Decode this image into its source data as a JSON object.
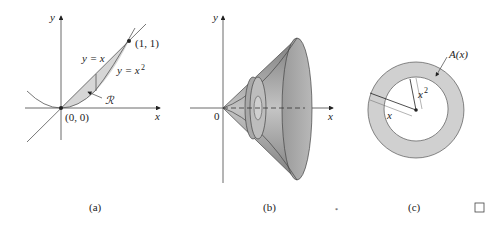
{
  "panel_a": {
    "axis_y": "y",
    "axis_x": "x",
    "line_label": "y = x",
    "curve_label": "y = x",
    "curve_exp": "2",
    "point_top": "(1, 1)",
    "origin": "(0, 0)",
    "region_label": "ℛ",
    "caption": "(a)"
  },
  "panel_b": {
    "axis_y": "y",
    "axis_x": "x",
    "origin": "0",
    "caption": "(b)"
  },
  "panel_c": {
    "area_label": "A(x)",
    "inner_radius_label": "x",
    "inner_radius_exp": "2",
    "outer_radius_label": "x",
    "caption": "(c)"
  },
  "end_marker": "□",
  "colors": {
    "shade": "#d6d6d6",
    "line": "#333333",
    "cone_dark": "#8a8a8a",
    "cone_light": "#c9c9c9"
  }
}
